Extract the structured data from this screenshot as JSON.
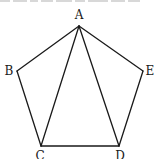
{
  "figure": {
    "type": "geometry",
    "stroke_color": "#1a1a1a",
    "background": "#ffffff",
    "vertices": {
      "A": {
        "label": "A",
        "x": 79,
        "y": 26,
        "label_x": 79,
        "label_y": 19
      },
      "B": {
        "label": "B",
        "x": 17,
        "y": 71,
        "label_x": 9,
        "label_y": 75
      },
      "C": {
        "label": "C",
        "x": 41,
        "y": 146,
        "label_x": 40,
        "label_y": 160
      },
      "D": {
        "label": "D",
        "x": 119,
        "y": 146,
        "label_x": 120,
        "label_y": 160
      },
      "E": {
        "label": "E",
        "x": 143,
        "y": 71,
        "label_x": 150,
        "label_y": 75
      }
    },
    "edges": [
      [
        "A",
        "B"
      ],
      [
        "B",
        "C"
      ],
      [
        "C",
        "D"
      ],
      [
        "D",
        "E"
      ],
      [
        "E",
        "A"
      ],
      [
        "A",
        "C"
      ],
      [
        "A",
        "D"
      ]
    ]
  }
}
